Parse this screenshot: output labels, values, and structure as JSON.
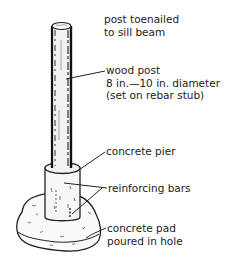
{
  "diagram": {
    "labels": {
      "post_top": [
        "post toenailed",
        "to sill beam"
      ],
      "wood_post": [
        "wood post",
        "8 in.—10 in. diameter",
        "(set on rebar stub)"
      ],
      "concrete_pier": [
        "concrete pier"
      ],
      "reinforcing_bars": [
        "reinforcing bars"
      ],
      "concrete_pad": [
        "concrete pad",
        "poured in hole"
      ]
    }
  }
}
